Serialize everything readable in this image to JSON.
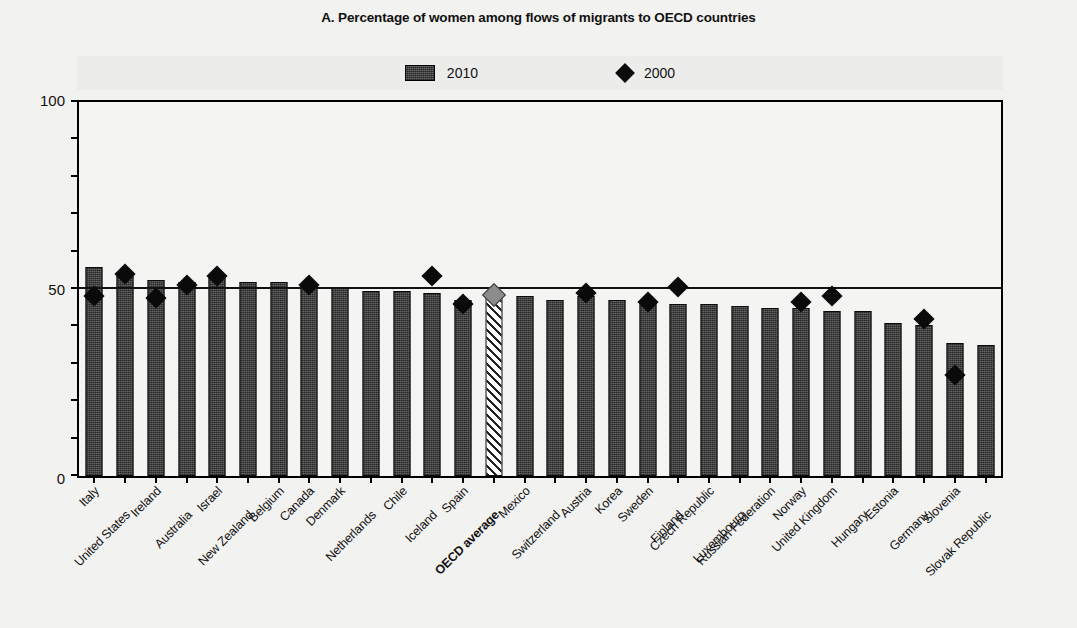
{
  "chart_data": {
    "type": "bar",
    "title": "A. Percentage of women among flows of migrants to OECD countries",
    "xlabel": "",
    "ylabel": "",
    "ylim": [
      0,
      100
    ],
    "yticks": [
      0,
      50,
      100
    ],
    "ytick_labels": [
      "0",
      "50",
      "100"
    ],
    "grid": false,
    "legend_position": "top-center",
    "reference_line": 50,
    "categories": [
      "Italy",
      "United States",
      "Ireland",
      "Australia",
      "Israel",
      "New Zealand",
      "Belgium",
      "Canada",
      "Denmark",
      "Netherlands",
      "Chile",
      "Iceland",
      "Spain",
      "OECD average",
      "Mexico",
      "Switzerland",
      "Austria",
      "Korea",
      "Sweden",
      "Finland",
      "Czech Republic",
      "Luxembourg",
      "Russian Federation",
      "Norway",
      "United Kingdom",
      "Hungary",
      "Estonia",
      "Germany",
      "Slovenia",
      "Slovak Republic"
    ],
    "series": [
      {
        "name": "2010",
        "type": "bar",
        "values": [
          56.0,
          53.5,
          52.5,
          52.0,
          53.0,
          52.0,
          52.0,
          51.0,
          50.5,
          49.5,
          49.5,
          49.0,
          47.0,
          48.5,
          48.0,
          47.0,
          48.0,
          47.0,
          46.5,
          46.0,
          46.0,
          45.5,
          45.0,
          45.0,
          44.0,
          44.0,
          41.0,
          40.5,
          35.5,
          35.0
        ]
      },
      {
        "name": "2000",
        "type": "scatter",
        "values": [
          48.0,
          54.0,
          47.5,
          51.0,
          53.5,
          null,
          null,
          51.0,
          null,
          null,
          null,
          53.5,
          46.0,
          48.5,
          null,
          null,
          49.0,
          null,
          46.5,
          50.5,
          null,
          null,
          null,
          46.5,
          48.0,
          null,
          null,
          42.0,
          27.0,
          null
        ]
      }
    ],
    "highlight_category": "OECD average"
  },
  "legend": {
    "entries": [
      {
        "label": "2010",
        "marker": "filled-rect",
        "color": "#484848"
      },
      {
        "label": "2000",
        "marker": "diamond",
        "color": "#0a0a0a"
      }
    ]
  },
  "colors": {
    "bar": "#484848",
    "marker": "#0a0a0a",
    "highlight_marker": "#8c8c8c",
    "axis": "#000000",
    "page_background": "#f2f2f0",
    "plot_background": "#f4f4f2",
    "legend_background": "#ececeb"
  }
}
